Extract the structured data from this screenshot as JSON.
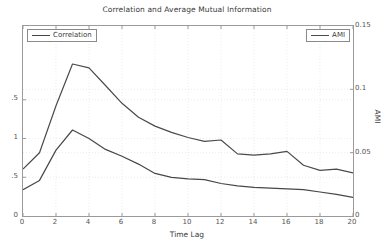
{
  "title": "Correlation and Average Mutual Information",
  "legends": [
    {
      "label": "Correlation"
    },
    {
      "label": "AMI"
    }
  ],
  "colors": {
    "correlation_line": "#474747",
    "ami_line": "#4a4a4a",
    "axis_border": "#9a9a9a",
    "grid_line": "#e4e4e4",
    "tick_text": "#555555",
    "title_text": "#3a3a3a"
  },
  "chart_data": {
    "type": "line",
    "title": "Correlation and Average Mutual Information",
    "xlabel": "Time Lag",
    "grid": true,
    "legend_positions": [
      "top-left",
      "top-right"
    ],
    "x": [
      0,
      1,
      2,
      3,
      4,
      5,
      6,
      7,
      8,
      9,
      10,
      11,
      12,
      13,
      14,
      15,
      16,
      17,
      18,
      19,
      20
    ],
    "x_axis": {
      "range": [
        0,
        20
      ],
      "tick_labels": [
        "0",
        "2",
        "4",
        "6",
        "8",
        "10",
        "12",
        "14",
        "16",
        "18",
        "20"
      ],
      "tick_values": [
        0,
        2,
        4,
        6,
        8,
        10,
        12,
        14,
        16,
        18,
        20
      ]
    },
    "y_left_axis": {
      "range": [
        0,
        2.452
      ],
      "tick_labels": [
        "0",
        "0.5",
        "1",
        "1.5"
      ],
      "tick_values": [
        0,
        0.5,
        1,
        1.5
      ],
      "labels_clipped_by_image_edge": true
    },
    "y_right_axis": {
      "label": "AMI",
      "range": [
        0,
        0.15
      ],
      "tick_labels": [
        "0",
        "0.05",
        "0.1",
        "0.15"
      ],
      "tick_values": [
        0,
        0.05,
        0.1,
        0.15
      ]
    },
    "series": [
      {
        "name": "Correlation",
        "axis": "left",
        "values": [
          0.34,
          0.46,
          0.85,
          1.11,
          1.0,
          0.86,
          0.77,
          0.67,
          0.55,
          0.5,
          0.48,
          0.47,
          0.42,
          0.39,
          0.37,
          0.36,
          0.35,
          0.34,
          0.31,
          0.28,
          0.24
        ]
      },
      {
        "name": "AMI",
        "axis": "right",
        "values": [
          0.037,
          0.05,
          0.087,
          0.12,
          0.117,
          0.103,
          0.089,
          0.078,
          0.071,
          0.066,
          0.062,
          0.059,
          0.06,
          0.049,
          0.048,
          0.049,
          0.051,
          0.04,
          0.036,
          0.037,
          0.034
        ]
      }
    ]
  }
}
